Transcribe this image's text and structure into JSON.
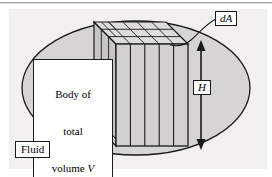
{
  "figure": {
    "canvas": {
      "width": 272,
      "height": 177
    },
    "colors": {
      "page_background": "#ffffff",
      "panel_background": "#f2f1ef",
      "top_rule": "#a8a8a8",
      "ellipse_fill": "#d6d5d3",
      "prism_front_fill": "#d2d1cf",
      "prism_top_fill": "#dedddb",
      "prism_side_fill": "#c6c5c3",
      "stroke": "#1a1a1a",
      "label_fill": "#ffffff"
    },
    "labels": {
      "body_line1": "Body of",
      "body_line2": "total",
      "body_line3_prefix": "volume ",
      "body_line3_symbol": "V",
      "fluid": "Fluid",
      "dA": "dA",
      "H": "H"
    },
    "annotations": {
      "height_arrow": "double-headed-vertical-arrow",
      "da_leader": "curved-leader-line"
    },
    "geometry": {
      "ellipse": {
        "cx": 136,
        "cy": 88,
        "rx": 114,
        "ry": 67
      },
      "prism": {
        "front": {
          "x": 116,
          "y": 44,
          "width": 72,
          "height": 102
        },
        "depth_dx": -22,
        "depth_dy": -22,
        "front_strip_count": 5,
        "top_grid_columns": 5,
        "top_grid_rows": 3
      },
      "height_arrow": {
        "x": 201,
        "y_top": 42,
        "y_bottom": 148
      }
    }
  }
}
